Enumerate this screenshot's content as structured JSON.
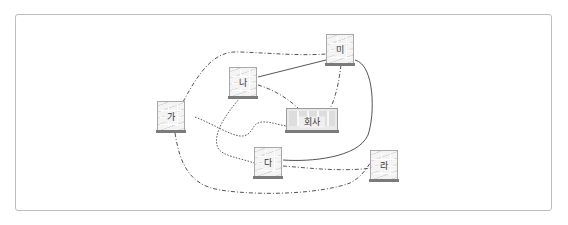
{
  "diagram": {
    "type": "network",
    "nodes": [
      {
        "id": "ga",
        "label": "가",
        "kind": "building"
      },
      {
        "id": "na",
        "label": "나",
        "kind": "building"
      },
      {
        "id": "da",
        "label": "다",
        "kind": "building"
      },
      {
        "id": "ra",
        "label": "라",
        "kind": "building"
      },
      {
        "id": "mi",
        "label": "미",
        "kind": "building"
      },
      {
        "id": "hq",
        "label": "회사",
        "kind": "headquarters"
      }
    ],
    "edges": [
      {
        "from": "ga",
        "to": "mi",
        "style": "dash-dot"
      },
      {
        "from": "ga",
        "to": "hq",
        "style": "dotted"
      },
      {
        "from": "ga",
        "to": "ra",
        "style": "dash-dot"
      },
      {
        "from": "na",
        "to": "mi",
        "style": "solid"
      },
      {
        "from": "na",
        "to": "hq",
        "style": "dash-dot"
      },
      {
        "from": "na",
        "to": "da",
        "style": "dotted"
      },
      {
        "from": "mi",
        "to": "hq",
        "style": "dash-dot"
      },
      {
        "from": "mi",
        "to": "da",
        "style": "solid"
      },
      {
        "from": "da",
        "to": "ra",
        "style": "dash-dot"
      }
    ]
  },
  "colors": {
    "line": "#444444",
    "frame": "#bdbdbd",
    "building_base": "#7b7b7b"
  }
}
